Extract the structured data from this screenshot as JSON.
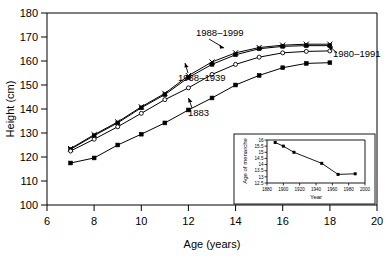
{
  "chart_data": [
    {
      "id": "main",
      "type": "line",
      "title": "",
      "xlabel": "Age (years)",
      "ylabel": "Height (cm)",
      "xlim": [
        6,
        20
      ],
      "ylim": [
        100,
        180
      ],
      "xticks": [
        6,
        8,
        10,
        12,
        14,
        16,
        18,
        20
      ],
      "yticks": [
        100,
        110,
        120,
        130,
        140,
        150,
        160,
        170,
        180
      ],
      "grid": false,
      "legend": "annotations-on-plot",
      "series": [
        {
          "name": "1988–1999",
          "marker": "cross",
          "x": [
            7,
            8,
            9,
            10,
            11,
            12,
            13,
            14,
            15,
            16,
            17,
            18
          ],
          "values": [
            123.5,
            129.3,
            134.6,
            140.9,
            146.5,
            153.9,
            159.6,
            163.4,
            165.6,
            166.6,
            167.0,
            167.0
          ]
        },
        {
          "name": "1980–1991",
          "marker": "filled-square",
          "x": [
            7,
            8,
            9,
            10,
            11,
            12,
            13,
            14,
            15,
            16,
            17,
            18
          ],
          "values": [
            123.2,
            128.9,
            134.2,
            140.5,
            146.0,
            153.1,
            158.6,
            162.6,
            165.1,
            166.1,
            166.4,
            166.4
          ]
        },
        {
          "name": "1938–1939",
          "marker": "open-circle",
          "x": [
            7,
            8,
            9,
            10,
            11,
            12,
            13,
            14,
            15,
            16,
            17,
            18
          ],
          "values": [
            122.5,
            127.4,
            132.6,
            138.2,
            143.9,
            148.8,
            154.4,
            158.6,
            161.6,
            163.4,
            164.0,
            164.2
          ]
        },
        {
          "name": "1883",
          "marker": "filled-square",
          "x": [
            7,
            8,
            9,
            10,
            11,
            12,
            13,
            14,
            15,
            16,
            17,
            18
          ],
          "values": [
            117.5,
            119.6,
            125.0,
            129.5,
            134.2,
            139.6,
            144.6,
            150.0,
            154.0,
            157.2,
            159.0,
            159.3
          ]
        }
      ],
      "annotations": [
        {
          "text": "1988–1999",
          "note": "points to upper cross series"
        },
        {
          "text": "1980–1991",
          "note": "points to upper filled-square series"
        },
        {
          "text": "1938–1939",
          "note": "points to open-circle series"
        },
        {
          "text": "1883",
          "note": "points to lowest filled-square series"
        }
      ]
    },
    {
      "id": "inset",
      "type": "line",
      "title": "",
      "xlabel": "Year",
      "ylabel": "Age of menarche",
      "xlim": [
        1880,
        2000
      ],
      "ylim": [
        12.5,
        16
      ],
      "xticks": [
        1880,
        1900,
        1920,
        1940,
        1960,
        1980,
        2000
      ],
      "yticks": [
        12.5,
        13,
        13.5,
        14,
        14.5,
        15,
        15.5,
        16
      ],
      "grid": false,
      "series": [
        {
          "name": "Age of menarche",
          "marker": "filled-square",
          "x": [
            1890,
            1900,
            1913,
            1947,
            1967,
            1988
          ],
          "values": [
            15.8,
            15.5,
            15.0,
            14.1,
            13.2,
            13.25
          ]
        }
      ]
    }
  ]
}
